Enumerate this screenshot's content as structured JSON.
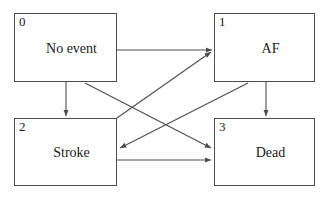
{
  "diagram": {
    "type": "state-transition-diagram",
    "line_color": "#4d4d4d",
    "text_color": "#1a1a1a",
    "background": "#ffffff",
    "states": [
      {
        "index": "0",
        "label": "No event"
      },
      {
        "index": "1",
        "label": "AF"
      },
      {
        "index": "2",
        "label": "Stroke"
      },
      {
        "index": "3",
        "label": "Dead"
      }
    ],
    "transitions": [
      {
        "from": "0",
        "to": "1",
        "style": "horizontal"
      },
      {
        "from": "0",
        "to": "2",
        "style": "vertical"
      },
      {
        "from": "0",
        "to": "3",
        "style": "diagonal"
      },
      {
        "from": "1",
        "to": "2",
        "style": "diagonal"
      },
      {
        "from": "1",
        "to": "3",
        "style": "vertical"
      },
      {
        "from": "2",
        "to": "1",
        "style": "diagonal"
      },
      {
        "from": "2",
        "to": "3",
        "style": "horizontal"
      }
    ]
  }
}
